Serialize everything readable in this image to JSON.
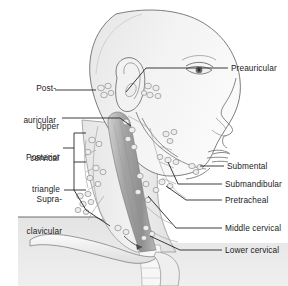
{
  "figure": {
    "background_color": "#ffffff",
    "line_color": "#1b1b1b",
    "skin_fill": "#f2f2f2",
    "shade_fill": "#e2e2e2",
    "muscle_fill": "#9e9e9e",
    "node_fill": "#ededed",
    "node_stroke": "#8a8a8a"
  },
  "labels": {
    "left": [
      {
        "id": "post-auricular",
        "line1": "Post-",
        "line2": "auricular"
      },
      {
        "id": "upper-cervical",
        "line1": "Upper",
        "line2": "cervical"
      },
      {
        "id": "posterior-triangle",
        "line1": "Posterior",
        "line2": "triangle"
      },
      {
        "id": "supraclavicular",
        "line1": "Supra-",
        "line2": "clavicular"
      }
    ],
    "right": [
      {
        "id": "preauricular",
        "text": "Preauricular"
      },
      {
        "id": "submental",
        "text": "Submental"
      },
      {
        "id": "submandibular",
        "text": "Submandibular"
      },
      {
        "id": "pretracheal",
        "text": "Pretracheal"
      },
      {
        "id": "middle-cervical",
        "text": "Middle cervical"
      },
      {
        "id": "lower-cervical",
        "text": "Lower cervical"
      }
    ]
  },
  "anatomy": {
    "parts": [
      "scalp",
      "ear",
      "eye",
      "nose",
      "lips",
      "jaw",
      "neck",
      "sternocleidomastoid",
      "clavicle",
      "shoulder",
      "trachea"
    ],
    "node_clusters": [
      "post-auricular-nodes",
      "preauricular-nodes",
      "upper-cervical-nodes",
      "posterior-triangle-nodes",
      "supraclavicular-nodes",
      "submental-nodes",
      "submandibular-nodes",
      "pretracheal-nodes",
      "middle-cervical-nodes",
      "lower-cervical-nodes",
      "facial-nodes"
    ]
  }
}
